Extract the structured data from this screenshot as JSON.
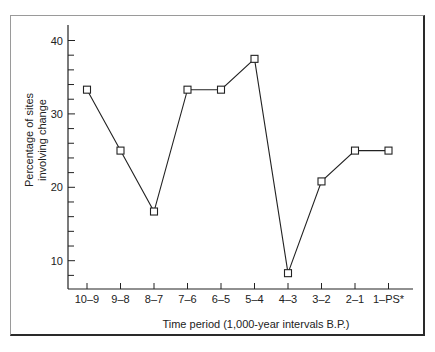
{
  "chart_data": {
    "type": "line",
    "title": "",
    "xlabel": "Time period (1,000-year intervals B.P.)",
    "ylabel": [
      "Percentage of sites",
      "involving change"
    ],
    "categories": [
      "10–9",
      "9–8",
      "8–7",
      "7–6",
      "6–5",
      "5–4",
      "4–3",
      "3–2",
      "2–1",
      "1–PS*"
    ],
    "series": [
      {
        "name": "Percentage of sites involving change",
        "values": [
          33.3,
          25.0,
          16.7,
          33.3,
          33.3,
          37.5,
          8.3,
          20.8,
          25.0,
          25.0
        ],
        "marker": "open-square",
        "color": "#222222"
      }
    ],
    "yticks_major": [
      10,
      20,
      30,
      40
    ],
    "yticks_minor_step": 2,
    "ylim": [
      6,
      42
    ],
    "grid": false,
    "legend": "none"
  }
}
